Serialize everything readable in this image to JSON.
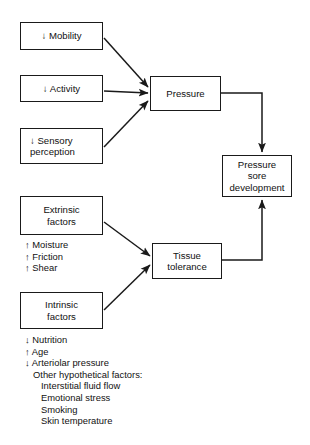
{
  "diagram": {
    "stroke_color": "#1a1a1a",
    "text_color": "#111111",
    "background": "#ffffff",
    "nodes": [
      {
        "id": "mobility",
        "lines": [
          "↓ Mobility"
        ],
        "x": 20,
        "y": 22,
        "w": 83,
        "h": 28,
        "align": "center"
      },
      {
        "id": "activity",
        "lines": [
          "↓ Activity"
        ],
        "x": 20,
        "y": 75,
        "w": 83,
        "h": 27,
        "align": "center"
      },
      {
        "id": "sensory-perception",
        "lines": [
          "↓ Sensory",
          "perception"
        ],
        "x": 20,
        "y": 128,
        "w": 83,
        "h": 36,
        "align": "left"
      },
      {
        "id": "extrinsic-factors",
        "lines": [
          "Extrinsic",
          "factors"
        ],
        "x": 20,
        "y": 196,
        "w": 83,
        "h": 39,
        "align": "center"
      },
      {
        "id": "intrinsic-factors",
        "lines": [
          "Intrinsic",
          "factors"
        ],
        "x": 20,
        "y": 292,
        "w": 83,
        "h": 37,
        "align": "center"
      },
      {
        "id": "pressure",
        "lines": [
          "Pressure"
        ],
        "x": 150,
        "y": 76,
        "w": 71,
        "h": 35,
        "align": "center"
      },
      {
        "id": "tissue-tolerance",
        "lines": [
          "Tissue",
          "tolerance"
        ],
        "x": 152,
        "y": 243,
        "w": 70,
        "h": 36,
        "align": "center"
      },
      {
        "id": "pressure-sore-development",
        "lines": [
          "Pressure",
          "sore",
          "development"
        ],
        "x": 222,
        "y": 155,
        "w": 70,
        "h": 42,
        "align": "center"
      }
    ],
    "extrinsic_list": {
      "x": 25,
      "y": 239,
      "items": [
        {
          "text": "↑ Moisture",
          "indent": 0
        },
        {
          "text": "↑ Friction",
          "indent": 0
        },
        {
          "text": "↑ Shear",
          "indent": 0
        }
      ]
    },
    "intrinsic_list": {
      "x": 25,
      "y": 334,
      "items": [
        {
          "text": "↓ Nutrition",
          "indent": 0
        },
        {
          "text": "↑ Age",
          "indent": 0
        },
        {
          "text": "↓ Arteriolar pressure",
          "indent": 0
        },
        {
          "text": "Other hypothetical factors:",
          "indent": 1
        },
        {
          "text": "Interstitial fluid flow",
          "indent": 2
        },
        {
          "text": "Emotional stress",
          "indent": 2
        },
        {
          "text": "Smoking",
          "indent": 2
        },
        {
          "text": "Skin temperature",
          "indent": 2
        }
      ]
    },
    "edges": [
      {
        "id": "mobility-to-pressure",
        "label": "decreased mobility increases pressure"
      },
      {
        "id": "activity-to-pressure",
        "label": "decreased activity increases pressure"
      },
      {
        "id": "sensory-to-pressure",
        "label": "decreased sensory perception increases pressure"
      },
      {
        "id": "extrinsic-to-tissue-tolerance",
        "label": "extrinsic factors affect tissue tolerance"
      },
      {
        "id": "intrinsic-to-tissue-tolerance",
        "label": "intrinsic factors affect tissue tolerance"
      },
      {
        "id": "pressure-to-pressure-sore",
        "label": "pressure leads to pressure sore development"
      },
      {
        "id": "tissue-tolerance-to-pressure-sore",
        "label": "tissue tolerance leads to pressure sore development"
      }
    ]
  }
}
